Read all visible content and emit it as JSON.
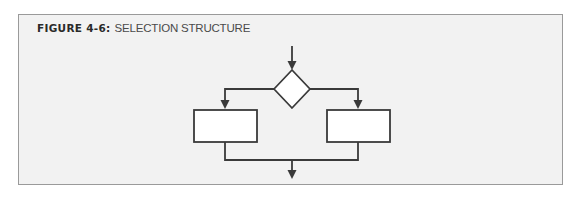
{
  "figure": {
    "label": "FIGURE 4-6:",
    "title": "SELECTION STRUCTURE"
  },
  "diagram": {
    "type": "flowchart",
    "nodes": [
      {
        "id": "decision",
        "shape": "diamond",
        "text": ""
      },
      {
        "id": "left-process",
        "shape": "rectangle",
        "text": ""
      },
      {
        "id": "right-process",
        "shape": "rectangle",
        "text": ""
      }
    ],
    "edges": [
      {
        "from": "entry",
        "to": "decision"
      },
      {
        "from": "decision",
        "to": "left-process"
      },
      {
        "from": "decision",
        "to": "right-process"
      },
      {
        "from": "left-process",
        "to": "exit"
      },
      {
        "from": "right-process",
        "to": "exit"
      }
    ]
  },
  "colors": {
    "background": "#f2f2f2",
    "border": "#9a9a9a",
    "stroke": "#3a3a3a",
    "shape_fill": "#ffffff"
  }
}
